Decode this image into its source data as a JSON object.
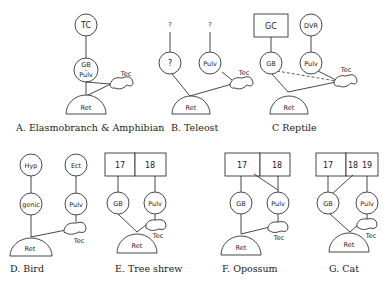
{
  "panels": [
    {
      "id": "A",
      "caption": "A. Elasmobranch & Amphibian",
      "nodes": {
        "top": "TC",
        "mid": "GB - Pulv",
        "ret": "Ret",
        "tec": "Tec"
      }
    },
    {
      "id": "B",
      "caption": "B. Teleost",
      "nodes": {
        "q1": "?",
        "q2": "?",
        "left": "?",
        "right": "Pulv",
        "ret": "Ret",
        "tec": "Tec"
      }
    },
    {
      "id": "C",
      "caption": "C Reptile",
      "nodes": {
        "box": "GC",
        "top": "DVR",
        "left": "GB",
        "right": "Pulv",
        "ret": "Ret",
        "tec": "Tec"
      }
    },
    {
      "id": "D",
      "caption": "D. Bird",
      "nodes": {
        "top_left": "Hyp",
        "top_right": "Ect",
        "left": "genic",
        "right": "Pulv",
        "ret": "Ret",
        "tec": "Tec"
      }
    },
    {
      "id": "E",
      "caption": "E. Tree shrew",
      "nodes": {
        "box_left": "17",
        "box_right": "18",
        "left": "GB",
        "right": "Pulv",
        "ret": "Ret",
        "tec": "Tec"
      }
    },
    {
      "id": "F",
      "caption": "F. Opossum",
      "nodes": {
        "box_left": "17",
        "box_right": "18",
        "left": "GB",
        "right": "Pulv",
        "ret": "Ret",
        "tec": "Tec"
      }
    },
    {
      "id": "G",
      "caption": "G. Cat",
      "nodes": {
        "box_left": "17",
        "box_mid": "18",
        "box_right": "19",
        "left": "GB",
        "right": "Pulv",
        "ret": "Ret",
        "tec": "Tec"
      }
    }
  ]
}
